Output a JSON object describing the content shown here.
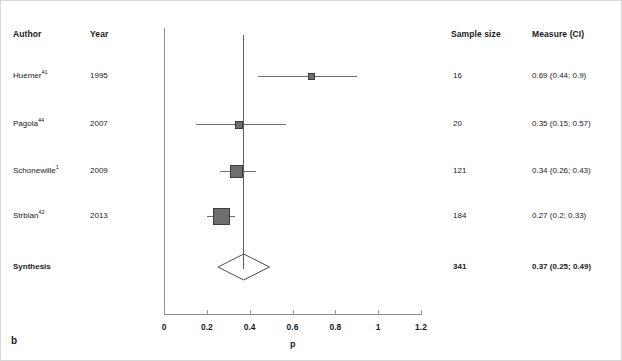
{
  "panel_label": "b",
  "columns": {
    "author": "Author",
    "year": "Year",
    "sample_size": "Sample size",
    "measure": "Measure (CI)"
  },
  "rows": [
    {
      "author": "Huemer",
      "ref": "41",
      "year": "1995",
      "n": "16",
      "measure": "0.69 (0.44; 0.9)",
      "estimate": 0.69,
      "ci_low": 0.44,
      "ci_high": 0.9,
      "bold": false
    },
    {
      "author": "Pagola",
      "ref": "44",
      "year": "2007",
      "n": "20",
      "measure": "0.35 (0.15; 0.57)",
      "estimate": 0.35,
      "ci_low": 0.15,
      "ci_high": 0.57,
      "bold": false
    },
    {
      "author": "Schonewille",
      "ref": "1",
      "year": "2009",
      "n": "121",
      "measure": "0.34 (0.26; 0.43)",
      "estimate": 0.34,
      "ci_low": 0.26,
      "ci_high": 0.43,
      "bold": false
    },
    {
      "author": "Strbian",
      "ref": "42",
      "year": "2013",
      "n": "184",
      "measure": "0.27 (0.2; 0.33)",
      "estimate": 0.27,
      "ci_low": 0.2,
      "ci_high": 0.33,
      "bold": false
    },
    {
      "author": "Synthesis",
      "ref": "",
      "year": "",
      "n": "341",
      "measure": "0.37 (0.25; 0.49)",
      "estimate": 0.37,
      "ci_low": 0.25,
      "ci_high": 0.49,
      "bold": true
    }
  ],
  "axis": {
    "title": "p",
    "ticks": [
      "0",
      "0.2",
      "0.4",
      "0.6",
      "0.8",
      "1",
      "1.2"
    ],
    "min": 0,
    "max": 1.2
  },
  "chart_data": {
    "type": "forest",
    "title": "",
    "xlabel": "p",
    "ylabel": "",
    "xlim": [
      0,
      1.2
    ],
    "xticks": [
      0,
      0.2,
      0.4,
      0.6,
      0.8,
      1,
      1.2
    ],
    "grid": false,
    "legend": "none",
    "reference_line": 0.37,
    "studies": [
      {
        "label": "Huemer 41",
        "year": 1995,
        "n": 16,
        "estimate": 0.69,
        "ci_low": 0.44,
        "ci_high": 0.9,
        "weight_marker": "small"
      },
      {
        "label": "Pagola 44",
        "year": 2007,
        "n": 20,
        "estimate": 0.35,
        "ci_low": 0.15,
        "ci_high": 0.57,
        "weight_marker": "small"
      },
      {
        "label": "Schonewille 1",
        "year": 2009,
        "n": 121,
        "estimate": 0.34,
        "ci_low": 0.26,
        "ci_high": 0.43,
        "weight_marker": "medium"
      },
      {
        "label": "Strbian 42",
        "year": 2013,
        "n": 184,
        "estimate": 0.27,
        "ci_low": 0.2,
        "ci_high": 0.33,
        "weight_marker": "large"
      }
    ],
    "summary": {
      "label": "Synthesis",
      "n": 341,
      "estimate": 0.37,
      "ci_low": 0.25,
      "ci_high": 0.49
    }
  },
  "layout": {
    "x0_px": 163,
    "px_per_unit": 214.2,
    "row_y_px": [
      75,
      123,
      170,
      215,
      266
    ],
    "marker_size_px": [
      7,
      8,
      13,
      17
    ],
    "axis_y_px": 313,
    "axis_top_px": 27,
    "axis_right_px": 420
  }
}
